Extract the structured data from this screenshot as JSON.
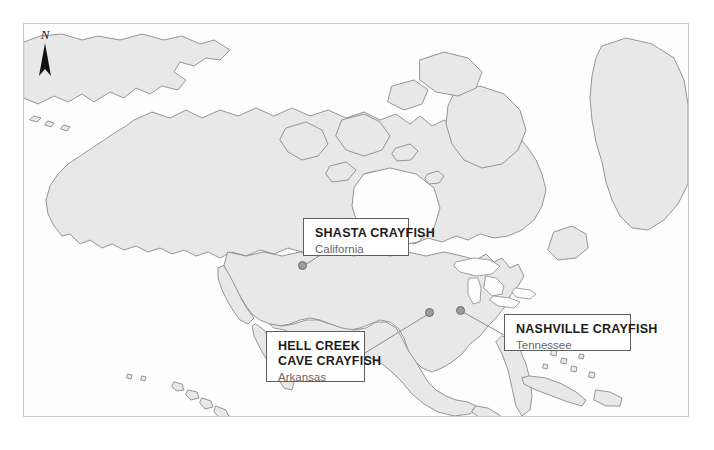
{
  "figure": {
    "type": "locator-map",
    "region": "North America",
    "background_color": "#ffffff",
    "frame_color": "#c9c9c9",
    "land_color": "#e8e8e8",
    "ocean_color": "#fdfdfd",
    "coastline_color": "#8a8a8a",
    "marker_color": "#9b9b9b",
    "leader_line_color": "#8c8c8c"
  },
  "north_arrow": {
    "label": "N",
    "icon": "north-arrow-icon"
  },
  "callouts": [
    {
      "id": "shasta",
      "title": "SHASTA CRAYFISH",
      "subtitle": "California",
      "marker": {
        "x": 302,
        "y": 265
      }
    },
    {
      "id": "hellcreek",
      "title_line1": "HELL CREEK",
      "title_line2": "CAVE CRAYFISH",
      "subtitle": "Arkansas",
      "marker": {
        "x": 429,
        "y": 312
      }
    },
    {
      "id": "nashville",
      "title": "NASHVILLE CRAYFISH",
      "subtitle": "Tennessee",
      "marker": {
        "x": 460,
        "y": 310
      }
    }
  ]
}
